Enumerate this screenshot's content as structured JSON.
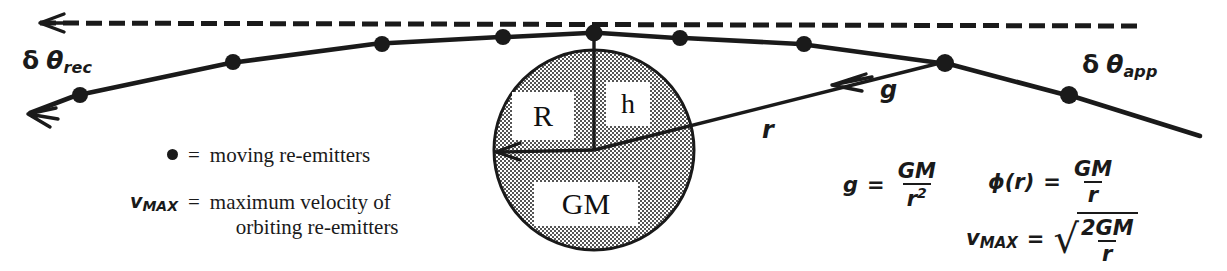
{
  "figure": {
    "ink_color": "#1a1a1a",
    "sphere_fill": "#9a9a9a",
    "background": "#ffffff"
  },
  "angle_labels": {
    "receding": {
      "delta": "δ",
      "theta": "θ",
      "subscript": "rec"
    },
    "approaching": {
      "delta": "δ",
      "theta": "θ",
      "subscript": "app"
    }
  },
  "sphere_labels": {
    "radius": "R",
    "height": "h",
    "mass": "GM"
  },
  "vector_labels": {
    "radius_line": "r",
    "gravity_arrow": "g"
  },
  "legend": [
    {
      "key_type": "dot",
      "key": "",
      "equals": "=",
      "value_line1": "moving re-emitters",
      "value_line2": ""
    },
    {
      "key_type": "text",
      "key": "v",
      "key_subscript": "MAX",
      "equals": "=",
      "value_line1": "maximum velocity of",
      "value_line2": "orbiting re-emitters"
    }
  ],
  "formulas": [
    {
      "name": "surface-gravity",
      "lhs": "g",
      "equals": "=",
      "numerator": "GM",
      "denominator": "r",
      "denominator_exponent": "2",
      "radical": false
    },
    {
      "name": "gravitational-potential",
      "lhs": "ϕ(r)",
      "equals": "=",
      "numerator": "GM",
      "denominator": "r",
      "denominator_exponent": "",
      "radical": false
    },
    {
      "name": "escape-velocity",
      "lhs": "v",
      "lhs_subscript": "MAX",
      "equals": "=",
      "numerator": "2GM",
      "denominator": "r",
      "denominator_exponent": "",
      "radical": true,
      "radical_glyph": "√"
    }
  ],
  "emitters": {
    "count": 9,
    "description": "moving re-emitters along the bent ray path"
  },
  "reference_ray": {
    "style": "dashed",
    "direction": "leftward",
    "description": "undeflected straight reference ray"
  }
}
